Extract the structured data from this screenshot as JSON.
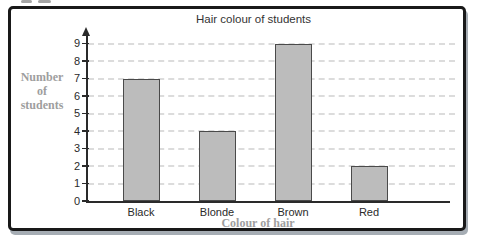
{
  "chart_data": {
    "type": "bar",
    "title": "Hair colour of students",
    "categories": [
      "Black",
      "Blonde",
      "Brown",
      "Red"
    ],
    "values": [
      7,
      4,
      9,
      2
    ],
    "xlabel": "Colour of hair",
    "ylabel": "Number of students",
    "ylabel_lines": [
      "Number",
      "of",
      "students"
    ],
    "ylim": [
      0,
      9
    ],
    "ytick_step": 1,
    "yticks": [
      0,
      1,
      2,
      3,
      4,
      5,
      6,
      7,
      8,
      9
    ],
    "grid": "horizontal-dashed",
    "legend": "none",
    "colors": {
      "bar_fill": "#bcbcbc",
      "bar_border": "#4a4a4a",
      "gridline": "#dcdcdc",
      "axis": "#2a2a2a",
      "title_text": "#333333",
      "tick_text": "#2a2a2a",
      "caption_text": "#9e9e9e",
      "frame_border": "#191919",
      "frame_shadow": "#a6adb4",
      "background": "#ffffff"
    }
  }
}
